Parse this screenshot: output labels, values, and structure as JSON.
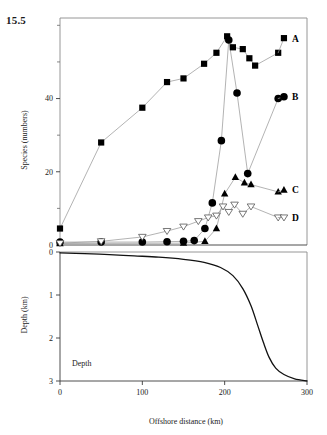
{
  "figure": {
    "number_label": "15.5",
    "inline_annotation": "Depth"
  },
  "chart_data": {
    "type": "line",
    "title": "",
    "xlabel": "Offshore distance (km)",
    "ylabel": "Species (numbers)",
    "xlim": [
      0,
      300
    ],
    "xticks": [
      0,
      100,
      200,
      300
    ],
    "xticklabels": [
      "0",
      "100",
      "200",
      "300"
    ],
    "grid": false,
    "legend_position": "right-inline",
    "panels": [
      {
        "name": "species-panel",
        "ylabel": "Species (numbers)",
        "ylim": [
          0,
          62
        ],
        "yticks": [
          0,
          20,
          40
        ],
        "yticklabels": [
          "0",
          "20",
          "40"
        ],
        "yminorticks": [
          10,
          30,
          50,
          60
        ],
        "series": [
          {
            "name": "A",
            "label": "A",
            "marker": "filled-square",
            "color": "#000000",
            "points": [
              [
                0,
                4.5
              ],
              [
                50,
                28.0
              ],
              [
                100,
                37.5
              ],
              [
                130,
                44.5
              ],
              [
                150,
                45.5
              ],
              [
                175,
                49.5
              ],
              [
                190,
                52.5
              ],
              [
                203,
                57.0
              ],
              [
                210,
                54.0
              ],
              [
                222,
                53.5
              ],
              [
                230,
                51.0
              ],
              [
                237,
                49.0
              ],
              [
                265,
                52.5
              ]
            ],
            "legend_marker_xy": [
              272,
              56.5
            ]
          },
          {
            "name": "B",
            "label": "B",
            "marker": "filled-circle",
            "color": "#000000",
            "points": [
              [
                0,
                0.8
              ],
              [
                50,
                0.8
              ],
              [
                100,
                0.8
              ],
              [
                130,
                0.9
              ],
              [
                150,
                1.0
              ],
              [
                163,
                1.2
              ],
              [
                176,
                4.5
              ],
              [
                185,
                11.5
              ],
              [
                196,
                28.5
              ],
              [
                205,
                56.0
              ],
              [
                215,
                41.5
              ],
              [
                228,
                19.5
              ],
              [
                265,
                40.0
              ]
            ],
            "legend_marker_xy": [
              272,
              40.5
            ]
          },
          {
            "name": "C",
            "label": "C",
            "marker": "filled-triangle-up",
            "color": "#000000",
            "points": [
              [
                0,
                0.4
              ],
              [
                150,
                0.5
              ],
              [
                176,
                1.0
              ],
              [
                190,
                4.5
              ],
              [
                200,
                14.0
              ],
              [
                213,
                18.5
              ],
              [
                224,
                17.0
              ],
              [
                232,
                16.5
              ],
              [
                265,
                14.5
              ]
            ],
            "legend_marker_xy": [
              272,
              15.0
            ]
          },
          {
            "name": "D",
            "label": "D",
            "marker": "open-triangle-down",
            "color": "#ffffff",
            "points": [
              [
                0,
                0.5
              ],
              [
                50,
                1.0
              ],
              [
                100,
                2.2
              ],
              [
                130,
                3.8
              ],
              [
                150,
                5.0
              ],
              [
                168,
                6.5
              ],
              [
                180,
                7.5
              ],
              [
                190,
                8.0
              ],
              [
                198,
                10.5
              ],
              [
                205,
                9.0
              ],
              [
                212,
                11.0
              ],
              [
                222,
                8.5
              ],
              [
                232,
                10.5
              ],
              [
                265,
                7.5
              ]
            ],
            "legend_marker_xy": [
              272,
              7.5
            ]
          }
        ]
      },
      {
        "name": "depth-panel",
        "ylabel": "Depth (km)",
        "ylim": [
          0,
          3
        ],
        "inverted": true,
        "yticks": [
          0,
          1,
          2,
          3
        ],
        "yticklabels": [
          "0",
          "1",
          "2",
          "3"
        ],
        "profile_name": "Depth",
        "profile": [
          [
            0,
            0.02
          ],
          [
            30,
            0.04
          ],
          [
            60,
            0.06
          ],
          [
            90,
            0.09
          ],
          [
            120,
            0.12
          ],
          [
            150,
            0.17
          ],
          [
            175,
            0.24
          ],
          [
            195,
            0.36
          ],
          [
            210,
            0.55
          ],
          [
            222,
            0.85
          ],
          [
            232,
            1.25
          ],
          [
            240,
            1.7
          ],
          [
            247,
            2.1
          ],
          [
            254,
            2.45
          ],
          [
            262,
            2.7
          ],
          [
            272,
            2.85
          ],
          [
            285,
            2.95
          ],
          [
            300,
            3.0
          ]
        ]
      }
    ]
  }
}
